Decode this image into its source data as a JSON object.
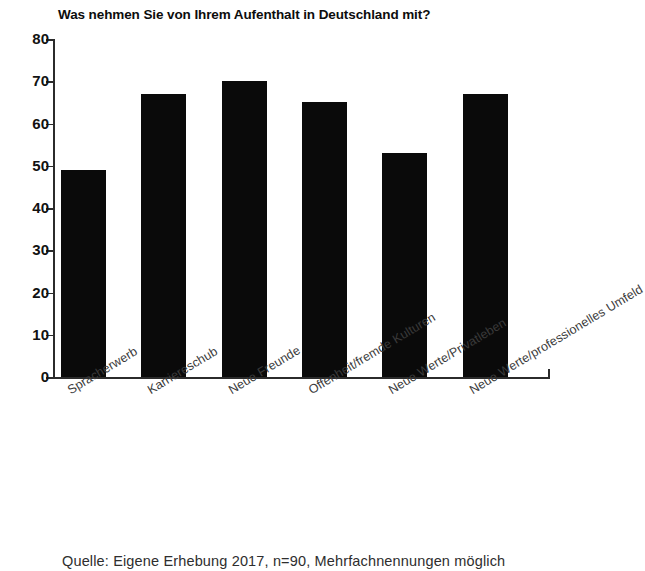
{
  "chart_data": {
    "type": "bar",
    "title": "Was nehmen Sie von Ihrem Aufenthalt in Deutschland mit?",
    "subtitle": "",
    "xlabel": "",
    "ylabel": "",
    "categories": [
      "Spracherwerb",
      "Karriereschub",
      "Neue Freunde",
      "Offenheit/fremde Kulturen",
      "Neue Werte/Privatleben",
      "Neue Werte/professionelles Umfeld"
    ],
    "values": [
      49,
      67,
      70,
      65,
      53,
      67
    ],
    "ylim": [
      0,
      80
    ],
    "ytick_step": 10,
    "yticks": [
      "0",
      "10",
      "20",
      "30",
      "40",
      "50",
      "60",
      "70",
      "80"
    ],
    "grid": false,
    "legend": false,
    "legend_position": "none",
    "bar_color": "#0a0a0a",
    "axis_color": "#2b2b2b",
    "category_label_rotation": -31
  },
  "caption": {
    "source_note": "Quelle: Eigene Erhebung 2017, n=90, Mehrfachnennungen möglich"
  }
}
